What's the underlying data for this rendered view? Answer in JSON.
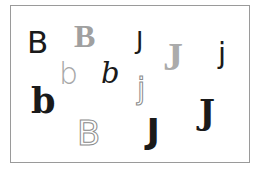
{
  "glyphs": [
    {
      "char": "B",
      "style": "sans-regular",
      "color": "#1a1a1a"
    },
    {
      "char": "B",
      "style": "serif-bold",
      "color": "#a0a0a0"
    },
    {
      "char": "J",
      "style": "sans-regular",
      "color": "#1a1a1a"
    },
    {
      "char": "J",
      "style": "serif-regular",
      "color": "#a8a8a8"
    },
    {
      "char": "j",
      "style": "sans-regular",
      "color": "#1a1a1a"
    },
    {
      "char": "b",
      "style": "sans-light",
      "color": "#a8a8a8"
    },
    {
      "char": "b",
      "style": "serif-italic",
      "color": "#1a1a1a"
    },
    {
      "char": "j",
      "style": "outline",
      "color": "#9a9a9a"
    },
    {
      "char": "b",
      "style": "slab-bold",
      "color": "#1a1a1a"
    },
    {
      "char": "B",
      "style": "outline",
      "color": "#9a9a9a"
    },
    {
      "char": "J",
      "style": "sans-black",
      "color": "#1a1a1a"
    },
    {
      "char": "J",
      "style": "serif-bold",
      "color": "#1a1a1a"
    }
  ]
}
